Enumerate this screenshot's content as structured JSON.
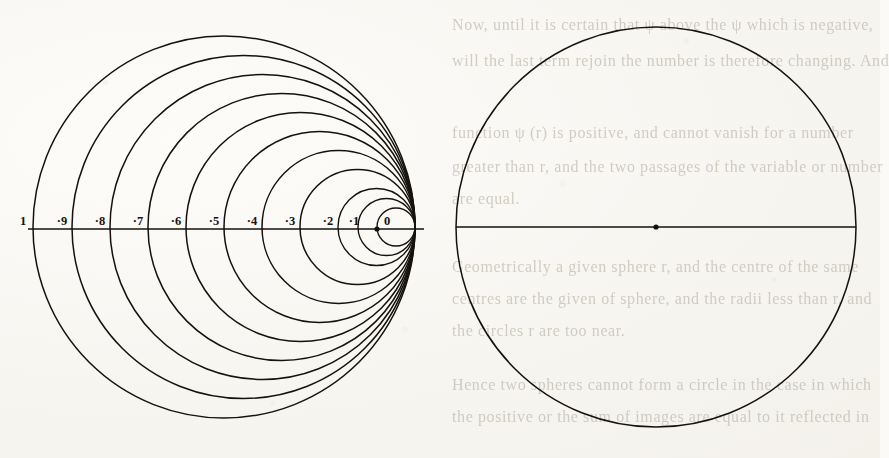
{
  "figure": {
    "caption": "",
    "type": "geometric-diagram"
  },
  "left_diagram": {
    "name": "coaxial-circle-family",
    "tangent_point_x": 415,
    "axis_y": 229,
    "axis_start_x": 28,
    "axis_end_x": 424,
    "center_dot": {
      "x": 377,
      "y": 229
    },
    "circles": [
      {
        "label": "1",
        "left_x": 33,
        "radius": 191
      },
      {
        "label": "·9",
        "left_x": 72,
        "radius": 171.5
      },
      {
        "label": "·8",
        "left_x": 110,
        "radius": 152.5
      },
      {
        "label": "·7",
        "left_x": 148,
        "radius": 133.5
      },
      {
        "label": "·6",
        "left_x": 186,
        "radius": 114.5
      },
      {
        "label": "·5",
        "left_x": 224,
        "radius": 95.5
      },
      {
        "label": "·4",
        "left_x": 262,
        "radius": 76.5
      },
      {
        "label": "·3",
        "left_x": 300,
        "radius": 57.5
      },
      {
        "label": "·2",
        "left_x": 338,
        "radius": 38.5
      },
      {
        "label": "·1",
        "left_x": 358,
        "radius": 28.5
      },
      {
        "label": "0",
        "left_x": 377,
        "radius": 19
      }
    ],
    "tick_labels": [
      {
        "text": "1",
        "x": 23,
        "y": 225
      },
      {
        "text": "·9",
        "x": 62,
        "y": 225
      },
      {
        "text": "·8",
        "x": 100,
        "y": 225
      },
      {
        "text": "·7",
        "x": 138,
        "y": 225
      },
      {
        "text": "·6",
        "x": 176,
        "y": 225
      },
      {
        "text": "·5",
        "x": 214,
        "y": 225
      },
      {
        "text": "·4",
        "x": 252,
        "y": 225
      },
      {
        "text": "·3",
        "x": 290,
        "y": 225
      },
      {
        "text": "·2",
        "x": 328,
        "y": 225
      },
      {
        "text": "·1",
        "x": 354,
        "y": 225
      },
      {
        "text": "0",
        "x": 387,
        "y": 225
      }
    ]
  },
  "right_diagram": {
    "name": "plain-circle",
    "center": {
      "x": 656,
      "y": 227
    },
    "radius": 200,
    "diameter_line": {
      "x1": 456,
      "y1": 227,
      "x2": 856,
      "y2": 227
    },
    "center_dot": {
      "x": 656,
      "y": 227
    }
  },
  "ghost_text": {
    "note": "faint show-through printing from the reverse of the page",
    "lines": [
      {
        "text": "Now, until it is certain that ψ above the ψ which is negative,",
        "x": 452,
        "y": 16,
        "size": 16
      },
      {
        "text": "will the last term rejoin the number is therefore changing. And",
        "x": 452,
        "y": 52,
        "size": 16
      },
      {
        "text": "function ψ (r) is positive, and cannot vanish for a number",
        "x": 452,
        "y": 124,
        "size": 16
      },
      {
        "text": "greater than r, and the two passages of the variable or number",
        "x": 452,
        "y": 158,
        "size": 16
      },
      {
        "text": "are equal.",
        "x": 452,
        "y": 190,
        "size": 16
      },
      {
        "text": "Geometrically a given sphere r, and the centre of the same",
        "x": 452,
        "y": 258,
        "size": 16
      },
      {
        "text": "centres are the given of sphere, and the radii less than r, and",
        "x": 452,
        "y": 290,
        "size": 16
      },
      {
        "text": "the circles r are too near.",
        "x": 452,
        "y": 322,
        "size": 16
      },
      {
        "text": "Hence two spheres cannot form a circle in the case in which",
        "x": 452,
        "y": 376,
        "size": 16
      },
      {
        "text": "the positive or the sum of images are equal to it reflected in",
        "x": 452,
        "y": 408,
        "size": 16
      }
    ]
  },
  "colors": {
    "ink": "#15120e",
    "paper": "#f7f5f0",
    "ghost": "#b9b2a4"
  }
}
